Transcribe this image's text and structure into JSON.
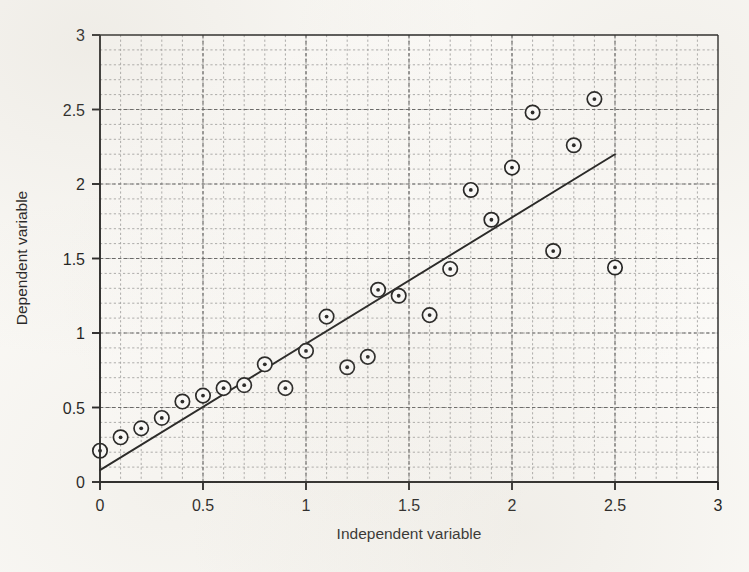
{
  "chart_data": {
    "type": "scatter",
    "title": "",
    "xlabel": "Independent variable",
    "ylabel": "Dependent variable",
    "xlim": [
      0,
      3
    ],
    "ylim": [
      0,
      3
    ],
    "xticks": [
      0,
      0.5,
      1,
      1.5,
      2,
      2.5,
      3
    ],
    "xtick_labels": [
      "0",
      "0.5",
      "1",
      "1.5",
      "2",
      "2.5",
      "3"
    ],
    "yticks": [
      0,
      0.5,
      1,
      1.5,
      2,
      2.5,
      3
    ],
    "ytick_labels": [
      "0",
      "0.5",
      "1",
      "1.5",
      "2",
      "2.5",
      "3"
    ],
    "grid": true,
    "grid_style": "dashed",
    "grid_minor_step": 0.1,
    "legend": "none",
    "marker": "circle-with-center-dot",
    "series": [
      {
        "name": "observations",
        "type": "scatter",
        "points": [
          [
            0.0,
            0.21
          ],
          [
            0.1,
            0.3
          ],
          [
            0.2,
            0.36
          ],
          [
            0.3,
            0.43
          ],
          [
            0.4,
            0.54
          ],
          [
            0.5,
            0.58
          ],
          [
            0.6,
            0.63
          ],
          [
            0.7,
            0.65
          ],
          [
            0.8,
            0.79
          ],
          [
            0.9,
            0.63
          ],
          [
            1.0,
            0.88
          ],
          [
            1.1,
            1.11
          ],
          [
            1.2,
            0.77
          ],
          [
            1.3,
            0.84
          ],
          [
            1.35,
            1.29
          ],
          [
            1.45,
            1.25
          ],
          [
            1.6,
            1.12
          ],
          [
            1.7,
            1.43
          ],
          [
            1.8,
            1.96
          ],
          [
            1.9,
            1.76
          ],
          [
            2.0,
            2.11
          ],
          [
            2.1,
            2.48
          ],
          [
            2.2,
            1.55
          ],
          [
            2.3,
            2.26
          ],
          [
            2.4,
            2.57
          ],
          [
            2.5,
            1.44
          ]
        ]
      },
      {
        "name": "regression-line",
        "type": "line",
        "endpoints": [
          [
            0.0,
            0.08
          ],
          [
            2.5,
            2.2
          ]
        ],
        "slope": 0.848,
        "intercept": 0.08
      }
    ]
  },
  "axes": {
    "x_title": "Independent variable",
    "y_title": "Dependent variable"
  },
  "colors": {
    "ink": "#1a1a1a",
    "grid": "#8d8d8d",
    "paper": "#fbfaf7",
    "marker_fill": "#ffffff",
    "marker_edge": "#141414"
  }
}
